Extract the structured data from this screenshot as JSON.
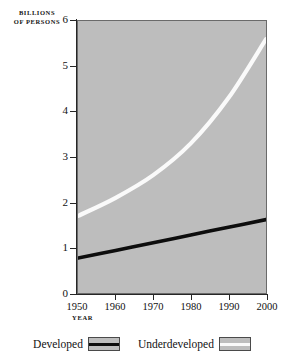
{
  "chart_data": {
    "type": "line",
    "title": "",
    "xlabel": "YEAR",
    "ylabel_lines": [
      "BILLIONS",
      "OF PERSONS"
    ],
    "ylabel": "BILLIONS OF PERSONS",
    "x": [
      1950,
      1960,
      1970,
      1980,
      1990,
      2000
    ],
    "xlim": [
      1950,
      2000
    ],
    "ylim": [
      0,
      6
    ],
    "xticks": [
      1950,
      1960,
      1970,
      1980,
      1990,
      2000
    ],
    "xtick_labels": [
      "1950",
      "1960",
      "1970",
      "1980",
      "1990",
      "2000"
    ],
    "yticks": [
      0,
      1,
      2,
      3,
      4,
      5,
      6
    ],
    "ytick_labels": [
      "0",
      "1",
      "2",
      "3",
      "4",
      "5",
      "6"
    ],
    "grid": false,
    "legend_position": "bottom",
    "plot_background": "#bdbdbd",
    "series": [
      {
        "name": "Developed",
        "color": "#0d0d0d",
        "values": [
          0.77,
          0.94,
          1.11,
          1.28,
          1.45,
          1.62
        ]
      },
      {
        "name": "Underdeveloped",
        "color": "#fafafa",
        "values": [
          1.7,
          2.1,
          2.6,
          3.3,
          4.3,
          5.6
        ]
      }
    ]
  },
  "legend": {
    "entries": [
      {
        "label": "Developed",
        "swatch": "dark"
      },
      {
        "label": "Underdeveloped",
        "swatch": "light"
      }
    ]
  },
  "axis": {
    "y_caption_line1": "BILLIONS",
    "y_caption_line2": "OF PERSONS",
    "x_caption": "YEAR"
  }
}
